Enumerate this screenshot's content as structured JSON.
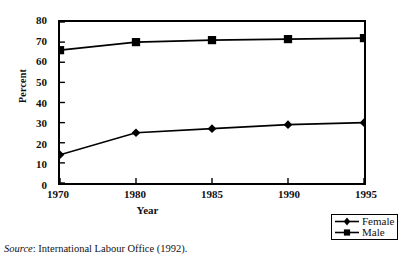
{
  "figure": {
    "clipped_title": "",
    "source_prefix": "Source",
    "source_text": ": International Labour Office (1992)."
  },
  "legend": {
    "position": "bottom-right",
    "items": [
      {
        "label": "Female",
        "marker": "diamond-marker-icon",
        "color": "#000000"
      },
      {
        "label": "Male",
        "marker": "square-marker-icon",
        "color": "#000000"
      }
    ]
  },
  "chart_data": {
    "type": "line",
    "title": "",
    "xlabel": "Year",
    "ylabel": "Percent",
    "categories": [
      "1970",
      "1980",
      "1985",
      "1990",
      "1995"
    ],
    "series": [
      {
        "name": "Female",
        "marker": "diamond",
        "values": [
          14,
          25,
          27,
          29,
          30
        ]
      },
      {
        "name": "Male",
        "marker": "square",
        "values": [
          66,
          70,
          71,
          71.5,
          72
        ]
      }
    ],
    "ylim": [
      0,
      80
    ],
    "yticks": [
      0,
      10,
      20,
      30,
      40,
      50,
      60,
      70,
      80
    ],
    "ytick_labels": [
      "0",
      "10",
      "20",
      "30",
      "40",
      "50",
      "60",
      "70",
      "80"
    ],
    "grid": false,
    "legend_position": "bottom-right"
  }
}
